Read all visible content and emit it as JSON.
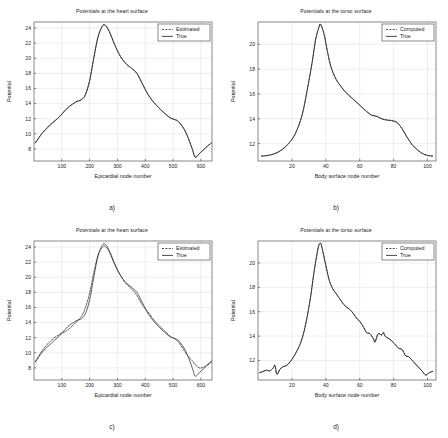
{
  "figure": {
    "width": 448,
    "height": 438,
    "background": "#ffffff",
    "line_color": "#1c1c1c",
    "grid_color": "#d8d8d8",
    "axis_color": "#3a3a3a"
  },
  "panels": [
    {
      "id": "a",
      "caption": "a)",
      "title": "Potentials at the heart surface",
      "xlabel": "Epicardial node number",
      "ylabel": "Potential",
      "legend": {
        "dashed": "Estimated",
        "solid": "True",
        "position": "top-right"
      },
      "chart_data": {
        "type": "line",
        "title": "Potentials at the heart surface",
        "xlabel": "Epicardial node number",
        "ylabel": "Potential",
        "xlim": [
          0,
          640
        ],
        "ylim": [
          6.4,
          24.8
        ],
        "xticks": [
          100,
          200,
          300,
          400,
          500,
          600
        ],
        "yticks": [
          8,
          10,
          12,
          14,
          16,
          18,
          20,
          22,
          24
        ],
        "grid": true,
        "legend_position": "upper right",
        "series": [
          {
            "name": "True",
            "style": "solid",
            "x": [
              5,
              30,
              60,
              90,
              120,
              150,
              170,
              185,
              200,
              215,
              230,
              245,
              255,
              270,
              290,
              310,
              330,
              350,
              370,
              390,
              410,
              430,
              450,
              470,
              490,
              505,
              520,
              540,
              555,
              570,
              580,
              595,
              610,
              625,
              638
            ],
            "y": [
              8.8,
              10.1,
              11.2,
              12.2,
              13.4,
              14.2,
              14.5,
              15.2,
              17.0,
              20.0,
              22.8,
              24.2,
              24.4,
              23.6,
              21.8,
              20.3,
              19.3,
              18.7,
              18.0,
              16.6,
              15.2,
              14.2,
              13.4,
              12.7,
              12.1,
              11.9,
              11.6,
              10.6,
              9.4,
              7.9,
              6.9,
              7.4,
              7.9,
              8.4,
              8.8
            ]
          },
          {
            "name": "Estimated",
            "style": "dashed",
            "x": [
              5,
              30,
              60,
              90,
              120,
              150,
              170,
              185,
              200,
              215,
              230,
              245,
              255,
              270,
              290,
              310,
              330,
              350,
              370,
              390,
              410,
              430,
              450,
              470,
              490,
              505,
              520,
              540,
              555,
              570,
              580,
              595,
              610,
              625,
              638
            ],
            "y": [
              8.8,
              10.1,
              11.3,
              12.2,
              13.4,
              14.2,
              14.5,
              15.2,
              17.1,
              20.1,
              22.8,
              24.2,
              24.4,
              23.6,
              21.8,
              20.3,
              19.3,
              18.7,
              18.0,
              16.6,
              15.2,
              14.2,
              13.4,
              12.7,
              12.1,
              11.9,
              11.6,
              10.6,
              9.4,
              7.9,
              6.9,
              7.4,
              7.9,
              8.4,
              8.8
            ]
          }
        ]
      }
    },
    {
      "id": "b",
      "caption": "b)",
      "title": "Potentials at the torso surface",
      "xlabel": "Body surface node number",
      "ylabel": "Potential",
      "legend": {
        "dashed": "Computed",
        "solid": "True",
        "position": "top-right"
      },
      "chart_data": {
        "type": "line",
        "title": "Potentials at the torso surface",
        "xlabel": "Body surface node number",
        "ylabel": "Potential",
        "xlim": [
          0,
          105
        ],
        "ylim": [
          10.6,
          21.8
        ],
        "xticks": [
          20,
          40,
          60,
          80,
          100
        ],
        "yticks": [
          12,
          14,
          16,
          18,
          20
        ],
        "grid": true,
        "legend_position": "upper right",
        "series": [
          {
            "name": "True",
            "style": "solid",
            "x": [
              2,
              6,
              10,
              14,
              18,
              22,
              26,
              29,
              32,
              34,
              36,
              37,
              39,
              41,
              43,
              46,
              49,
              52,
              56,
              60,
              64,
              67,
              70,
              73,
              76,
              79,
              82,
              85,
              88,
              91,
              94,
              97,
              100,
              103
            ],
            "y": [
              11.0,
              11.05,
              11.2,
              11.5,
              12.0,
              12.8,
              14.3,
              16.3,
              18.6,
              20.4,
              21.4,
              21.6,
              20.8,
              19.4,
              18.2,
              17.2,
              16.6,
              16.1,
              15.6,
              15.1,
              14.6,
              14.3,
              14.2,
              14.0,
              13.9,
              13.85,
              13.7,
              13.2,
              12.5,
              11.9,
              11.5,
              11.2,
              11.05,
              11.0
            ]
          },
          {
            "name": "Computed",
            "style": "dashed",
            "x": [
              2,
              6,
              10,
              14,
              18,
              22,
              26,
              29,
              32,
              34,
              36,
              37,
              39,
              41,
              43,
              46,
              49,
              52,
              56,
              60,
              64,
              67,
              70,
              73,
              76,
              79,
              82,
              85,
              88,
              91,
              94,
              97,
              100,
              103
            ],
            "y": [
              11.0,
              11.05,
              11.2,
              11.5,
              12.0,
              12.8,
              14.3,
              16.3,
              18.6,
              20.4,
              21.4,
              21.6,
              20.8,
              19.4,
              18.2,
              17.2,
              16.6,
              16.1,
              15.6,
              15.1,
              14.6,
              14.3,
              14.2,
              14.0,
              13.9,
              13.85,
              13.7,
              13.2,
              12.5,
              11.9,
              11.5,
              11.2,
              11.05,
              11.0
            ]
          }
        ]
      }
    },
    {
      "id": "c",
      "caption": "c)",
      "title": "Potentials at the heart surface",
      "xlabel": "Epicardial node number",
      "ylabel": "Potential",
      "legend": {
        "dashed": "Estimated",
        "solid": "True",
        "position": "top-right"
      },
      "chart_data": {
        "type": "line",
        "title": "Potentials at the heart surface",
        "xlabel": "Epicardial node number",
        "ylabel": "Potential",
        "xlim": [
          0,
          640
        ],
        "ylim": [
          6.4,
          24.8
        ],
        "xticks": [
          100,
          200,
          300,
          400,
          500,
          600
        ],
        "yticks": [
          8,
          10,
          12,
          14,
          16,
          18,
          20,
          22,
          24
        ],
        "grid": true,
        "legend_position": "upper right",
        "series": [
          {
            "name": "True",
            "style": "solid",
            "x": [
              5,
              30,
              60,
              90,
              120,
              150,
              170,
              185,
              200,
              215,
              230,
              245,
              255,
              270,
              290,
              310,
              330,
              350,
              370,
              390,
              410,
              430,
              450,
              470,
              490,
              505,
              520,
              540,
              555,
              570,
              580,
              595,
              610,
              625,
              638
            ],
            "y": [
              8.8,
              10.1,
              11.2,
              12.2,
              13.4,
              14.2,
              14.5,
              15.2,
              17.0,
              20.0,
              22.8,
              24.2,
              24.4,
              23.6,
              21.8,
              20.3,
              19.3,
              18.7,
              18.0,
              16.6,
              15.2,
              14.2,
              13.4,
              12.7,
              12.1,
              11.9,
              11.6,
              10.6,
              9.4,
              7.9,
              6.9,
              7.4,
              7.9,
              8.4,
              8.8
            ]
          },
          {
            "name": "Estimated",
            "style": "dashed",
            "x": [
              5,
              30,
              60,
              90,
              120,
              150,
              170,
              185,
              200,
              215,
              230,
              245,
              255,
              270,
              290,
              310,
              330,
              350,
              370,
              390,
              410,
              430,
              450,
              470,
              490,
              505,
              520,
              540,
              555,
              570,
              580,
              595,
              610,
              625,
              638
            ],
            "y": [
              8.8,
              10.3,
              11.6,
              12.4,
              13.0,
              14.0,
              14.8,
              16.0,
              17.9,
              20.6,
              22.9,
              23.9,
              24.1,
              23.4,
              21.7,
              20.3,
              19.2,
              18.5,
              17.6,
              16.3,
              15.4,
              14.4,
              13.6,
              12.9,
              12.2,
              11.9,
              11.4,
              10.3,
              9.5,
              8.9,
              8.4,
              8.0,
              8.1,
              8.5,
              8.9
            ]
          }
        ]
      }
    },
    {
      "id": "d",
      "caption": "d)",
      "title": "Potentials at the torso surface",
      "xlabel": "Body surface node number",
      "ylabel": "Potential",
      "legend": {
        "dashed": "Computed",
        "solid": "True",
        "position": "top-right"
      },
      "chart_data": {
        "type": "line",
        "title": "Potentials at the torso surface",
        "xlabel": "Body surface node number",
        "ylabel": "Potential",
        "xlim": [
          0,
          105
        ],
        "ylim": [
          10.4,
          21.8
        ],
        "xticks": [
          20,
          40,
          60,
          80,
          100
        ],
        "yticks": [
          12,
          14,
          16,
          18,
          20
        ],
        "grid": true,
        "legend_position": "upper right",
        "note": "noisy measured data",
        "series": [
          {
            "name": "True",
            "style": "solid",
            "x": [
              1,
              3,
              5,
              7,
              9,
              10,
              11,
              12,
              13,
              15,
              17,
              19,
              21,
              23,
              25,
              27,
              29,
              31,
              33,
              35,
              36,
              37,
              38,
              40,
              42,
              44,
              46,
              48,
              50,
              52,
              54,
              56,
              58,
              60,
              62,
              64,
              66,
              68,
              69,
              70,
              71,
              73,
              74,
              75,
              77,
              79,
              81,
              83,
              85,
              87,
              89,
              91,
              93,
              95,
              97,
              99,
              101,
              103
            ],
            "y": [
              11.0,
              11.1,
              11.2,
              11.15,
              11.4,
              11.6,
              10.9,
              11.0,
              11.3,
              11.5,
              11.6,
              11.9,
              12.3,
              12.8,
              13.4,
              14.3,
              15.6,
              17.2,
              19.2,
              20.9,
              21.5,
              21.6,
              21.1,
              19.8,
              18.6,
              17.9,
              17.5,
              17.1,
              16.7,
              16.4,
              16.2,
              15.9,
              15.5,
              15.2,
              14.8,
              14.3,
              14.2,
              13.8,
              13.5,
              13.9,
              14.2,
              14.1,
              14.3,
              14.0,
              13.8,
              13.6,
              13.3,
              13.0,
              12.9,
              12.4,
              12.3,
              12.0,
              11.7,
              11.4,
              11.1,
              10.8,
              11.0,
              11.1
            ]
          },
          {
            "name": "Computed",
            "style": "dashed",
            "x": [
              1,
              3,
              5,
              7,
              9,
              10,
              11,
              12,
              13,
              15,
              17,
              19,
              21,
              23,
              25,
              27,
              29,
              31,
              33,
              35,
              36,
              37,
              38,
              40,
              42,
              44,
              46,
              48,
              50,
              52,
              54,
              56,
              58,
              60,
              62,
              64,
              66,
              68,
              69,
              70,
              71,
              73,
              74,
              75,
              77,
              79,
              81,
              83,
              85,
              87,
              89,
              91,
              93,
              95,
              97,
              99,
              101,
              103
            ],
            "y": [
              11.0,
              11.1,
              11.2,
              11.15,
              11.4,
              11.6,
              10.9,
              11.0,
              11.3,
              11.5,
              11.6,
              11.9,
              12.3,
              12.8,
              13.4,
              14.3,
              15.6,
              17.2,
              19.2,
              20.9,
              21.5,
              21.6,
              21.1,
              19.8,
              18.6,
              17.9,
              17.5,
              17.1,
              16.7,
              16.4,
              16.2,
              15.9,
              15.5,
              15.2,
              14.8,
              14.3,
              14.2,
              13.8,
              13.5,
              13.9,
              14.2,
              14.1,
              14.3,
              14.0,
              13.8,
              13.6,
              13.3,
              13.0,
              12.9,
              12.4,
              12.3,
              12.0,
              11.7,
              11.4,
              11.1,
              10.8,
              11.0,
              11.1
            ]
          }
        ]
      }
    }
  ]
}
